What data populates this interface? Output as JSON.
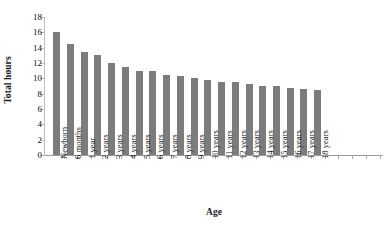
{
  "chart_data": {
    "type": "bar",
    "title": "",
    "xlabel": "Age",
    "ylabel": "Total hours",
    "ylim": [
      0,
      18
    ],
    "yticks": [
      0,
      2,
      4,
      6,
      8,
      10,
      12,
      14,
      16,
      18
    ],
    "grid": false,
    "legend": null,
    "bar_color": "#7c7c7c",
    "trailing_empty_ticks": 4,
    "categories": [
      "Newborn",
      "6 months",
      "1 year",
      "2 years",
      "3 years",
      "4 years",
      "5 years",
      "6 years",
      "7 years",
      "8 years",
      "9 years",
      "10 years",
      "11 years",
      "12 years",
      "13 years",
      "14 years",
      "15 years",
      "16 years",
      "17 years",
      "18 years"
    ],
    "values": [
      16.0,
      14.5,
      13.5,
      13.0,
      12.0,
      11.5,
      11.0,
      11.0,
      10.5,
      10.25,
      10.0,
      9.75,
      9.5,
      9.5,
      9.25,
      9.0,
      9.0,
      8.75,
      8.6,
      8.5
    ]
  }
}
